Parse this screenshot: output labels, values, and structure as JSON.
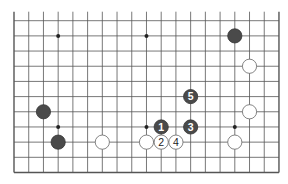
{
  "diagram": {
    "type": "go-board-partial",
    "columns": 19,
    "visible_rows": 11,
    "edges": {
      "left": true,
      "right": true,
      "bottom": true,
      "top": false
    },
    "colors": {
      "line": "#555555",
      "black_stone": "#4a4a4a",
      "white_stone": "#ffffff",
      "white_outline": "#666666",
      "background": "#ffffff"
    },
    "star_points": [
      {
        "col": 3,
        "row": 1
      },
      {
        "col": 9,
        "row": 1
      },
      {
        "col": 3,
        "row": 7
      },
      {
        "col": 9,
        "row": 7
      },
      {
        "col": 15,
        "row": 7
      }
    ],
    "stones": [
      {
        "color": "black",
        "col": 15,
        "row": 1,
        "label": ""
      },
      {
        "color": "white",
        "col": 16,
        "row": 3,
        "label": ""
      },
      {
        "color": "white",
        "col": 16,
        "row": 6,
        "label": ""
      },
      {
        "color": "white",
        "col": 15,
        "row": 8,
        "label": ""
      },
      {
        "color": "black",
        "col": 2,
        "row": 6,
        "label": ""
      },
      {
        "color": "black",
        "col": 3,
        "row": 8,
        "label": ""
      },
      {
        "color": "white",
        "col": 6,
        "row": 8,
        "label": ""
      },
      {
        "color": "white",
        "col": 9,
        "row": 8,
        "label": ""
      },
      {
        "color": "black",
        "col": 10,
        "row": 7,
        "label": "1"
      },
      {
        "color": "white",
        "col": 10,
        "row": 8,
        "label": "2"
      },
      {
        "color": "black",
        "col": 12,
        "row": 7,
        "label": "3"
      },
      {
        "color": "white",
        "col": 11,
        "row": 8,
        "label": "4"
      },
      {
        "color": "black",
        "col": 12,
        "row": 5,
        "label": "5"
      }
    ]
  }
}
